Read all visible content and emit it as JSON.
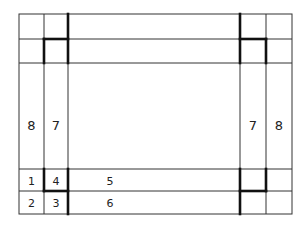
{
  "diagram": {
    "title": "",
    "labels": {
      "left_outer": "8",
      "left_inner": "7",
      "right_inner": "7",
      "right_outer": "8",
      "cell_1": "1",
      "cell_2": "2",
      "cell_3": "3",
      "cell_4": "4",
      "band_5": "5",
      "band_6": "6"
    },
    "grid": {
      "x_lines": [
        19,
        44,
        68,
        240,
        266,
        292
      ],
      "y_lines": [
        14,
        39,
        63,
        169,
        191,
        214
      ]
    }
  }
}
